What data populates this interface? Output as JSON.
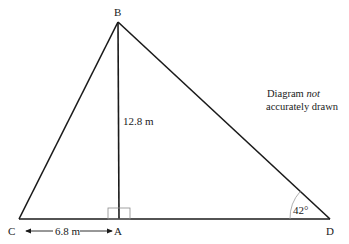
{
  "diagram": {
    "type": "geometry-triangle",
    "points": {
      "B": {
        "label": "B",
        "x": 118,
        "y": 22
      },
      "C": {
        "label": "C",
        "x": 19,
        "y": 219
      },
      "A": {
        "label": "A",
        "x": 119,
        "y": 219
      },
      "D": {
        "label": "D",
        "x": 330,
        "y": 219
      }
    },
    "measurements": {
      "BA": "12.8 m",
      "CA": "6.8 m",
      "angle_D": "42°"
    },
    "right_angle_at": "A",
    "note": {
      "line1_prefix": "Diagram ",
      "line1_emph": "not",
      "line2": "accurately drawn"
    },
    "colors": {
      "line": "#1a1a1a",
      "arc": "#9a9a9a",
      "right_angle_box": "#8a8a8a",
      "background": "#ffffff"
    }
  }
}
